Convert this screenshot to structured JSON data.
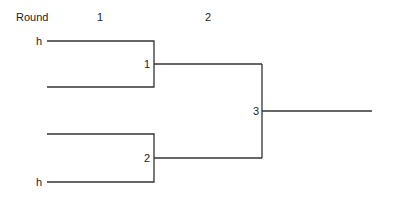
{
  "header": {
    "round_label": "Round",
    "rounds": [
      "1",
      "2"
    ]
  },
  "bracket": {
    "round1": [
      {
        "match": "1",
        "top_seed": "h",
        "bottom_seed": ""
      },
      {
        "match": "2",
        "top_seed": "",
        "bottom_seed": "h"
      }
    ],
    "round2": [
      {
        "match": "3"
      }
    ],
    "line_color": "#333333"
  }
}
